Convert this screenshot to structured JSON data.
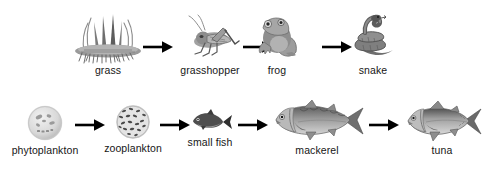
{
  "diagram": {
    "background_color": "#ffffff",
    "ink_color": "#161616",
    "arrow_color": "#000000",
    "chains": [
      {
        "id": "terrestrial",
        "name": "terrestrial-food-chain",
        "nodes": [
          {
            "label": "grass",
            "icon": "grass-tuft-icon"
          },
          {
            "label": "grasshopper",
            "icon": "grasshopper-icon"
          },
          {
            "label": "frog",
            "icon": "frog-icon"
          },
          {
            "label": "snake",
            "icon": "snake-icon"
          }
        ],
        "arrows": [
          {
            "name": "arrow-grass-to-grasshopper"
          },
          {
            "name": "arrow-grasshopper-to-frog"
          },
          {
            "name": "arrow-frog-to-snake"
          }
        ]
      },
      {
        "id": "aquatic",
        "name": "aquatic-food-chain",
        "nodes": [
          {
            "label": "phytoplankton",
            "icon": "phytoplankton-icon"
          },
          {
            "label": "zooplankton",
            "icon": "zooplankton-icon"
          },
          {
            "label": "small fish",
            "icon": "small-fish-icon"
          },
          {
            "label": "mackerel",
            "icon": "mackerel-icon"
          },
          {
            "label": "tuna",
            "icon": "tuna-icon"
          }
        ],
        "arrows": [
          {
            "name": "arrow-phytoplankton-to-zooplankton"
          },
          {
            "name": "arrow-zooplankton-to-small-fish"
          },
          {
            "name": "arrow-small-fish-to-mackerel"
          },
          {
            "name": "arrow-mackerel-to-tuna"
          }
        ]
      }
    ]
  }
}
